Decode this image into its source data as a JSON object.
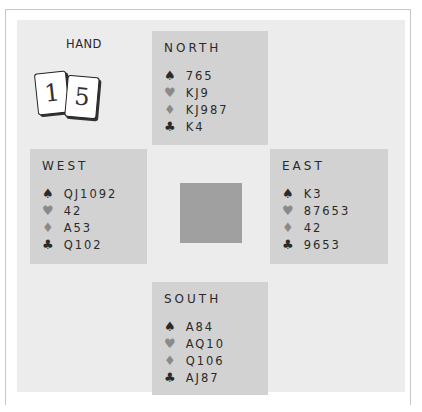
{
  "hand_panel": {
    "label": "HAND",
    "number_cards": [
      "1",
      "5"
    ]
  },
  "hands": {
    "north": {
      "title": "NORTH",
      "spades": "765",
      "hearts": "KJ9",
      "diamonds": "KJ987",
      "clubs": "K4"
    },
    "west": {
      "title": "WEST",
      "spades": "QJ1092",
      "hearts": "42",
      "diamonds": "A53",
      "clubs": "Q102"
    },
    "east": {
      "title": "EAST",
      "spades": "K3",
      "hearts": "87653",
      "diamonds": "42",
      "clubs": "9653"
    },
    "south": {
      "title": "SOUTH",
      "spades": "A84",
      "hearts": "AQ10",
      "diamonds": "Q106",
      "clubs": "AJ87"
    }
  },
  "suit_symbols": {
    "spades": "♠",
    "hearts": "♥",
    "diamonds": "♦",
    "clubs": "♣"
  },
  "colors": {
    "table_background": "#ececec",
    "hand_box": "#d2d2d2",
    "center_square": "#a0a0a0",
    "red_suit": "#8a8a8a",
    "black_suit": "#2a2a2a"
  }
}
